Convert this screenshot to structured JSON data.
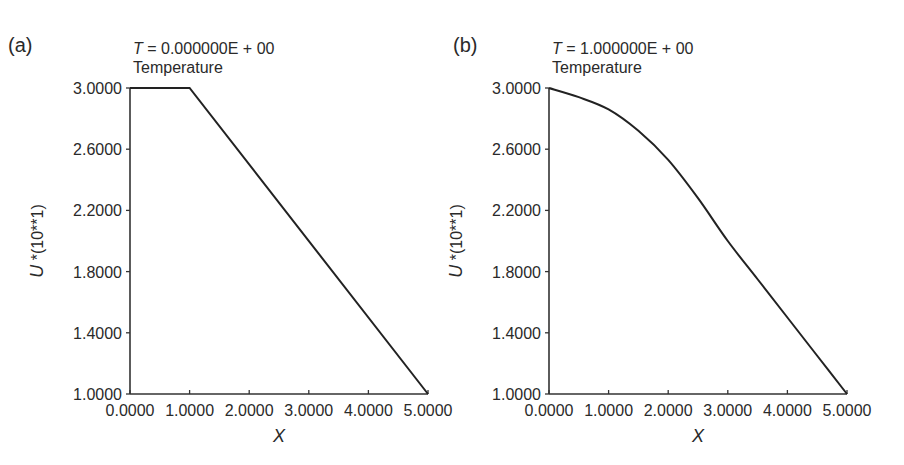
{
  "chart_data": [
    {
      "panel_label": "(a)",
      "type": "line",
      "title": "Temperature",
      "subtitle_var": "T",
      "subtitle_value": "= 0.000000E + 00",
      "xlabel": "X",
      "ylabel": "U *(10**1)",
      "xlim": [
        0,
        5
      ],
      "ylim": [
        1,
        3
      ],
      "xticks": [
        "0.0000",
        "1.0000",
        "2.0000",
        "3.0000",
        "4.0000",
        "5.0000"
      ],
      "yticks": [
        "1.0000",
        "1.4000",
        "1.8000",
        "2.2000",
        "2.6000",
        "3.0000"
      ],
      "grid": false,
      "series": [
        {
          "name": "Temperature",
          "x": [
            0,
            1,
            5
          ],
          "y": [
            3.0,
            3.0,
            1.0
          ]
        }
      ]
    },
    {
      "panel_label": "(b)",
      "type": "line",
      "title": "Temperature",
      "subtitle_var": "T",
      "subtitle_value": "= 1.000000E + 00",
      "xlabel": "X",
      "ylabel": "U *(10**1)",
      "xlim": [
        0,
        5
      ],
      "ylim": [
        1,
        3
      ],
      "xticks": [
        "0.0000",
        "1.0000",
        "2.0000",
        "3.0000",
        "4.0000",
        "5.0000"
      ],
      "yticks": [
        "1.0000",
        "1.4000",
        "1.8000",
        "2.2000",
        "2.6000",
        "3.0000"
      ],
      "grid": false,
      "series": [
        {
          "name": "Temperature",
          "x": [
            0,
            0.5,
            1.0,
            1.5,
            2.0,
            2.5,
            3.0,
            3.5,
            4.0,
            4.5,
            5.0
          ],
          "y": [
            3.0,
            2.94,
            2.86,
            2.72,
            2.53,
            2.28,
            2.0,
            1.75,
            1.5,
            1.25,
            1.0
          ]
        }
      ]
    }
  ]
}
